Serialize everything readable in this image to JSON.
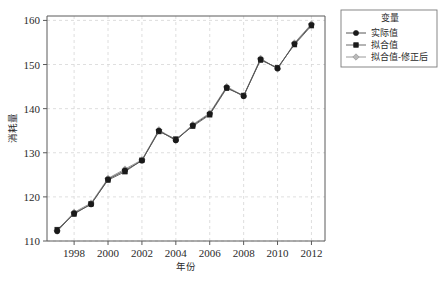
{
  "chart_data": {
    "type": "line",
    "title": "",
    "xlabel": "年份",
    "ylabel": "消耗量",
    "xlim": [
      1996.4,
      2012.8
    ],
    "ylim": [
      110,
      161
    ],
    "xticks": [
      1998,
      2000,
      2002,
      2004,
      2006,
      2008,
      2010,
      2012
    ],
    "yticks": [
      110,
      120,
      130,
      140,
      150,
      160
    ],
    "grid": true,
    "legend_position": "top-right",
    "legend_title": "变量",
    "x": [
      1997,
      1998,
      1999,
      2000,
      2001,
      2002,
      2003,
      2004,
      2005,
      2006,
      2007,
      2008,
      2009,
      2010,
      2011,
      2012
    ],
    "series": [
      {
        "name": "实际值",
        "marker": "circle",
        "color": "#1a1a1a",
        "line_color": "#555555",
        "values": [
          112.2,
          116.3,
          118.3,
          124.0,
          126.0,
          128.2,
          135.0,
          132.8,
          136.2,
          138.8,
          144.8,
          142.8,
          151.2,
          149.1,
          154.7,
          159.0
        ]
      },
      {
        "name": "拟合值",
        "marker": "square",
        "color": "#1a1a1a",
        "line_color": "#6b6b6b",
        "values": [
          112.6,
          116.1,
          118.4,
          123.8,
          125.7,
          128.3,
          134.8,
          133.1,
          136.0,
          138.6,
          144.6,
          143.0,
          151.0,
          149.3,
          154.5,
          158.8
        ]
      },
      {
        "name": "拟合值-修正后",
        "marker": "diamond",
        "color": "#b9b9b9",
        "line_color": "#9a9a9a",
        "values": [
          112.4,
          116.5,
          118.6,
          124.2,
          126.3,
          128.4,
          135.2,
          132.9,
          136.4,
          139.0,
          145.0,
          142.9,
          151.4,
          149.0,
          154.9,
          159.2
        ]
      }
    ]
  },
  "legend": {
    "title": "变量",
    "entries": [
      {
        "label": "实际值",
        "marker": "circle"
      },
      {
        "label": "拟合值",
        "marker": "square"
      },
      {
        "label": "拟合值-修正后",
        "marker": "diamond"
      }
    ]
  },
  "axes": {
    "x_title": "年份",
    "y_title": "消耗量",
    "x_tick_labels": [
      "1998",
      "2000",
      "2002",
      "2004",
      "2006",
      "2008",
      "2010",
      "2012"
    ],
    "y_tick_labels": [
      "110",
      "120",
      "130",
      "140",
      "150",
      "160"
    ]
  },
  "colors": {
    "actual": "#1a1a1a",
    "fitted": "#1a1a1a",
    "fitted_corrected": "#b9b9b9",
    "grid": "#d6d6d6",
    "axis": "#5a5a5a",
    "background": "#ffffff"
  }
}
